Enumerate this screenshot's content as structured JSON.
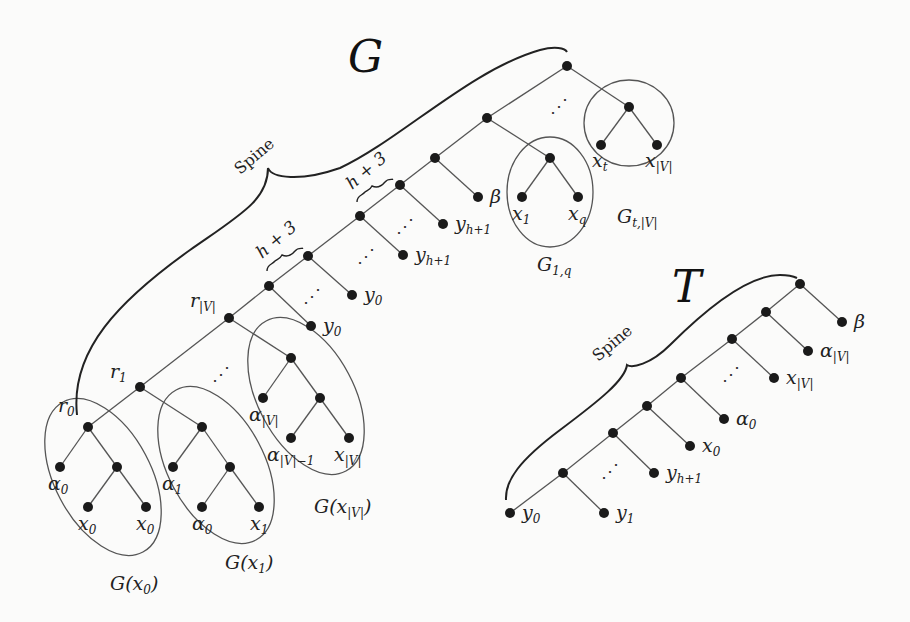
{
  "figure": {
    "tree_G": {
      "title": "G",
      "spine_label": "Spine",
      "brace_labels": [
        "h + 3",
        "h + 3"
      ],
      "node_labels": {
        "r0": {
          "base": "r",
          "sub": "0"
        },
        "r1": {
          "base": "r",
          "sub": "1"
        },
        "rV": {
          "base": "r",
          "sub": "|V|"
        }
      },
      "leaf_labels": {
        "beta": {
          "base": "β",
          "sub": ""
        },
        "y_h1_top": {
          "base": "y",
          "sub": "h+1"
        },
        "y_h1_mid": {
          "base": "y",
          "sub": "h+1"
        },
        "y0_a": {
          "base": "y",
          "sub": "0"
        },
        "y0_b": {
          "base": "y",
          "sub": "0"
        },
        "x1": {
          "base": "x",
          "sub": "1"
        },
        "xq": {
          "base": "x",
          "sub": "q"
        },
        "xt": {
          "base": "x",
          "sub": "t"
        },
        "xV_top": {
          "base": "x",
          "sub": "|V|"
        }
      },
      "gadgets": [
        {
          "id": "G1q",
          "label": {
            "base": "G",
            "sub": "1,q"
          }
        },
        {
          "id": "GtV",
          "label": {
            "base": "G",
            "sub": "t,|V|"
          }
        },
        {
          "id": "Gx0",
          "label": {
            "base": "G(x",
            "sub": "0",
            "tail": ")"
          },
          "leaves": [
            {
              "base": "α",
              "sub": "0"
            },
            {
              "base": "x",
              "sub": "0"
            },
            {
              "base": "x",
              "sub": "0"
            }
          ]
        },
        {
          "id": "Gx1",
          "label": {
            "base": "G(x",
            "sub": "1",
            "tail": ")"
          },
          "leaves": [
            {
              "base": "α",
              "sub": "1"
            },
            {
              "base": "α",
              "sub": "0"
            },
            {
              "base": "x",
              "sub": "1"
            }
          ]
        },
        {
          "id": "GxV",
          "label": {
            "base": "G(x",
            "sub": "|V|",
            "tail": ")"
          },
          "leaves": [
            {
              "base": "α",
              "sub": "|V|"
            },
            {
              "base": "α",
              "sub": "|V|−1"
            },
            {
              "base": "x",
              "sub": "|V|"
            }
          ]
        }
      ]
    },
    "tree_T": {
      "title": "T",
      "spine_label": "Spine",
      "leaf_labels": [
        {
          "base": "β",
          "sub": ""
        },
        {
          "base": "α",
          "sub": "|V|"
        },
        {
          "base": "x",
          "sub": "|V|"
        },
        {
          "base": "α",
          "sub": "0"
        },
        {
          "base": "x",
          "sub": "0"
        },
        {
          "base": "y",
          "sub": "h+1"
        },
        {
          "base": "y",
          "sub": "1"
        },
        {
          "base": "y",
          "sub": "0"
        }
      ]
    },
    "ellipsis": "⋰"
  }
}
